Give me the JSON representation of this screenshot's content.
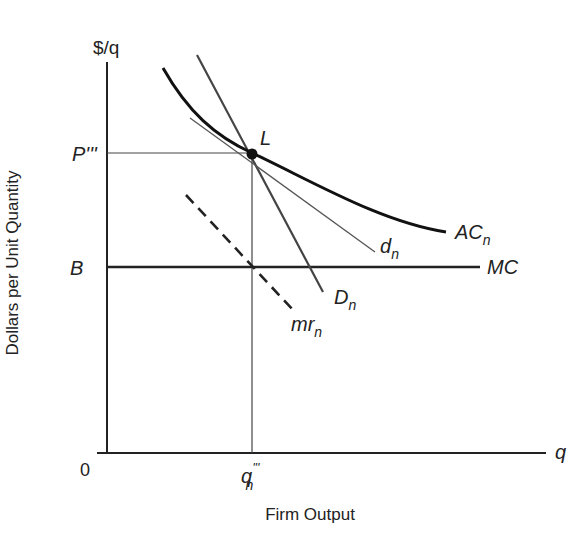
{
  "diagram": {
    "y_axis": {
      "unit_label": "$/q",
      "title": "Dollars per Unit Quantity"
    },
    "x_axis": {
      "unit_label": "q",
      "title": "Firm Output",
      "origin_label": "0"
    },
    "levels": {
      "price_label": "P'''",
      "b_label": "B",
      "quantity_label": "q",
      "quantity_sub": "n",
      "quantity_sup": "'''"
    },
    "point": {
      "label": "L"
    },
    "curves": {
      "ac": {
        "label": "AC",
        "sub": "n",
        "style": "thick-curve"
      },
      "d_small": {
        "label": "d",
        "sub": "n",
        "style": "thin-line"
      },
      "mc": {
        "label": "MC",
        "style": "thick-horizontal"
      },
      "d_big": {
        "label": "D",
        "sub": "n",
        "style": "medium-line"
      },
      "mr": {
        "label": "mr",
        "sub": "n",
        "style": "dashed-line"
      }
    },
    "colors": {
      "ink": "#222222",
      "thin": "#555555",
      "background": "#ffffff"
    }
  }
}
